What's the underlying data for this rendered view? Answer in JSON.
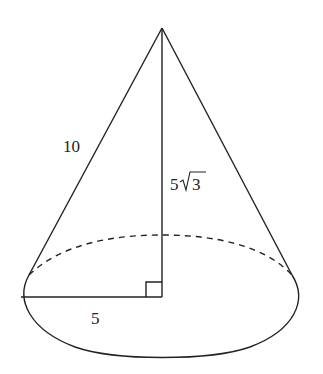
{
  "figure": {
    "type": "cone",
    "labels": {
      "slant_height": "10",
      "height": "5√3",
      "height_coeff": "5",
      "height_radicand": "3",
      "radius": "5"
    },
    "colors": {
      "stroke": "#222222",
      "background": "#ffffff"
    }
  }
}
